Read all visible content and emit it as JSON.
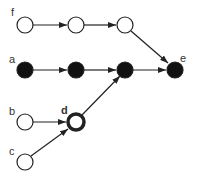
{
  "diagram": {
    "type": "directed-graph",
    "colors": {
      "edge": "#222222",
      "filled": "#111111",
      "hollow": "#ffffff",
      "stroke": "#222222"
    },
    "labels": {
      "f": "f",
      "a": "a",
      "e": "e",
      "b": "b",
      "d": "d",
      "c": "c"
    },
    "nodes": [
      {
        "id": "f",
        "label": "f",
        "style": "hollow"
      },
      {
        "id": "f2",
        "label": "",
        "style": "hollow"
      },
      {
        "id": "f3",
        "label": "",
        "style": "hollow"
      },
      {
        "id": "a",
        "label": "a",
        "style": "filled"
      },
      {
        "id": "a2",
        "label": "",
        "style": "filled"
      },
      {
        "id": "a3",
        "label": "",
        "style": "filled"
      },
      {
        "id": "e",
        "label": "e",
        "style": "filled"
      },
      {
        "id": "b",
        "label": "b",
        "style": "hollow"
      },
      {
        "id": "d",
        "label": "d",
        "style": "thick-ring"
      },
      {
        "id": "c",
        "label": "c",
        "style": "hollow"
      }
    ],
    "edges": [
      {
        "from": "f",
        "to": "f2"
      },
      {
        "from": "f2",
        "to": "f3"
      },
      {
        "from": "f3",
        "to": "e"
      },
      {
        "from": "a",
        "to": "a2"
      },
      {
        "from": "a2",
        "to": "a3"
      },
      {
        "from": "a3",
        "to": "e"
      },
      {
        "from": "b",
        "to": "d"
      },
      {
        "from": "c",
        "to": "d"
      },
      {
        "from": "d",
        "to": "a3"
      }
    ]
  }
}
